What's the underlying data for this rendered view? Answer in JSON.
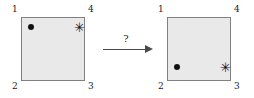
{
  "figure": {
    "background_color": "#ffffff",
    "square_fill_color": "#e9e9e9",
    "square_border_color": "#808080",
    "mark_color": "#111111",
    "arrow_color": "#4a4a4a"
  },
  "panels": [
    {
      "name": "before-square",
      "corner_labels": {
        "top_left": "1",
        "top_right": "4",
        "bottom_left": "2",
        "bottom_right": "3"
      },
      "marks": [
        {
          "glyph": "dot",
          "char": "●",
          "position": "top-left"
        },
        {
          "glyph": "asterisk",
          "char": "✳",
          "position": "top-right"
        }
      ]
    },
    {
      "name": "after-square",
      "corner_labels": {
        "top_left": "1",
        "top_right": "4",
        "bottom_left": "2",
        "bottom_right": "3"
      },
      "marks": [
        {
          "glyph": "dot",
          "char": "●",
          "position": "bottom-left"
        },
        {
          "glyph": "asterisk",
          "char": "✳",
          "position": "bottom-right"
        }
      ]
    }
  ],
  "transition": {
    "label": "?",
    "direction": "right"
  }
}
